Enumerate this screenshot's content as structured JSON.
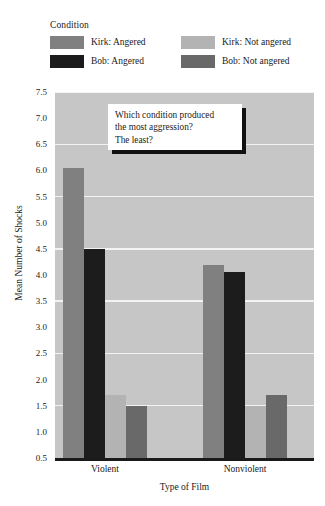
{
  "legend": {
    "title": "Condition",
    "entries": [
      {
        "label": "Kirk: Angered",
        "color": "#808080"
      },
      {
        "label": "Kirk: Not angered",
        "color": "#b3b3b3"
      },
      {
        "label": "Bob: Angered",
        "color": "#1c1c1c"
      },
      {
        "label": "Bob: Not angered",
        "color": "#696969"
      }
    ]
  },
  "callout": {
    "lines": [
      "Which condition produced",
      "the most aggression?",
      "The least?"
    ]
  },
  "axes": {
    "y_title": "Mean Number of Shocks",
    "x_title": "Type of Film",
    "y_ticks": [
      "7.5",
      "7.0",
      "6.5",
      "6.0",
      "5.5",
      "5.0",
      "4.5",
      "4.0",
      "3.5",
      "3.0",
      "2.5",
      "2.0",
      "1.5",
      "1.0",
      "0.5"
    ],
    "x_categories": [
      "Violent",
      "Nonviolent"
    ]
  },
  "colors": {
    "plot_background": "#c6c6c6",
    "gridline": "#f2f2f2",
    "axis": "#1a1a1a",
    "page_background": "#ffffff",
    "callout_shadow": "#111111"
  },
  "chart_data": {
    "type": "bar",
    "title": "",
    "xlabel": "Type of Film",
    "ylabel": "Mean Number of Shocks",
    "ylim": [
      0.5,
      7.5
    ],
    "ytick_step": 0.5,
    "gridlines_at": [
      1.5,
      2.5,
      3.5,
      4.5,
      5.5,
      6.5,
      7.5
    ],
    "grid": true,
    "legend_position": "above-plot",
    "legend_title": "Condition",
    "categories": [
      "Violent",
      "Nonviolent"
    ],
    "series": [
      {
        "name": "Kirk: Angered",
        "color": "#808080",
        "values": [
          6.05,
          4.2
        ]
      },
      {
        "name": "Bob: Angered",
        "color": "#1c1c1c",
        "values": [
          4.5,
          4.05
        ]
      },
      {
        "name": "Kirk: Not angered",
        "color": "#b3b3b3",
        "values": [
          1.7,
          1.5
        ]
      },
      {
        "name": "Bob: Not angered",
        "color": "#696969",
        "values": [
          1.5,
          1.7
        ]
      }
    ],
    "annotations": [
      {
        "type": "callout-box",
        "text": "Which condition produced the most aggression? The least?"
      }
    ]
  }
}
